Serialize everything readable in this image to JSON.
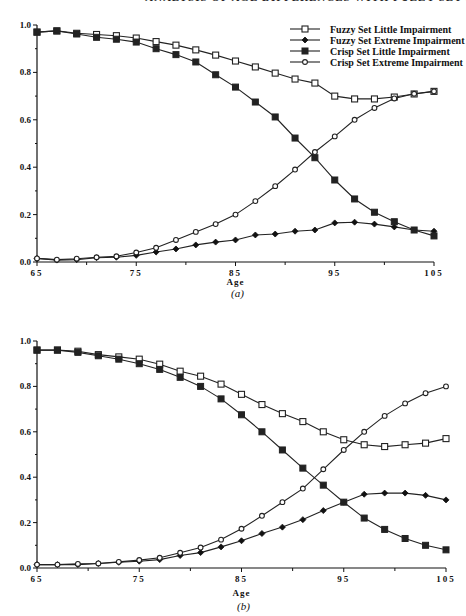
{
  "running_head": "ANALYSIS OF AGE DIFFERENCES WITH FUZZY SET MODELS",
  "chart_data": [
    {
      "type": "line",
      "caption": "(a)",
      "xlabel": "Age",
      "ylabel": "",
      "xlim": [
        65,
        105
      ],
      "ylim": [
        0,
        1.0
      ],
      "xticks": [
        65,
        75,
        85,
        95,
        105
      ],
      "xtick_labels": [
        "65",
        "75",
        "85",
        "95",
        "105"
      ],
      "yticks": [
        0,
        0.2,
        0.4,
        0.6,
        0.8,
        1.0
      ],
      "ytick_labels": [
        "0.0",
        "0.2",
        "0.4",
        "0.6",
        "0.8",
        "1.0"
      ],
      "legend_position": "top-right",
      "x": [
        65,
        67,
        69,
        71,
        73,
        75,
        77,
        79,
        81,
        83,
        85,
        87,
        89,
        91,
        93,
        95,
        97,
        99,
        101,
        103,
        105
      ],
      "series": [
        {
          "name": "Fuzzy Set Little Impairment",
          "marker": "open-square",
          "values": [
            0.97,
            0.975,
            0.965,
            0.96,
            0.955,
            0.945,
            0.93,
            0.915,
            0.895,
            0.873,
            0.848,
            0.823,
            0.797,
            0.772,
            0.755,
            0.7,
            0.688,
            0.688,
            0.696,
            0.709,
            0.72
          ]
        },
        {
          "name": "Fuzzy Set Extreme Impairment",
          "marker": "filled-diamond",
          "values": [
            0.015,
            0.008,
            0.01,
            0.018,
            0.02,
            0.028,
            0.042,
            0.055,
            0.072,
            0.084,
            0.093,
            0.114,
            0.118,
            0.13,
            0.135,
            0.165,
            0.168,
            0.16,
            0.148,
            0.135,
            0.13
          ]
        },
        {
          "name": "Crisp Set Little Impairment",
          "marker": "filled-square",
          "values": [
            0.97,
            0.975,
            0.962,
            0.948,
            0.94,
            0.928,
            0.9,
            0.875,
            0.844,
            0.79,
            0.738,
            0.675,
            0.612,
            0.523,
            0.44,
            0.346,
            0.266,
            0.21,
            0.17,
            0.135,
            0.11
          ]
        },
        {
          "name": "Crisp Set Extreme Impairment",
          "marker": "open-diamond",
          "values": [
            0.015,
            0.01,
            0.014,
            0.02,
            0.024,
            0.04,
            0.06,
            0.093,
            0.127,
            0.16,
            0.2,
            0.257,
            0.32,
            0.39,
            0.464,
            0.53,
            0.6,
            0.65,
            0.69,
            0.71,
            0.72
          ]
        }
      ]
    },
    {
      "type": "line",
      "caption": "(b)",
      "xlabel": "Age",
      "ylabel": "",
      "xlim": [
        65,
        105
      ],
      "ylim": [
        0,
        1.0
      ],
      "xticks": [
        65,
        75,
        85,
        95,
        105
      ],
      "xtick_labels": [
        "65",
        "75",
        "85",
        "95",
        "105"
      ],
      "yticks": [
        0,
        0.2,
        0.4,
        0.6,
        0.8,
        1.0
      ],
      "ytick_labels": [
        "0.0",
        "0.2",
        "0.4",
        "0.6",
        "0.8",
        "1.0"
      ],
      "legend_position": "none",
      "x": [
        65,
        67,
        69,
        71,
        73,
        75,
        77,
        79,
        81,
        83,
        85,
        87,
        89,
        91,
        93,
        95,
        97,
        99,
        101,
        103,
        105
      ],
      "series": [
        {
          "name": "Fuzzy Set Little Impairment",
          "marker": "open-square",
          "values": [
            0.96,
            0.96,
            0.955,
            0.94,
            0.93,
            0.92,
            0.898,
            0.867,
            0.845,
            0.81,
            0.765,
            0.72,
            0.68,
            0.645,
            0.6,
            0.565,
            0.543,
            0.535,
            0.543,
            0.55,
            0.57
          ]
        },
        {
          "name": "Fuzzy Set Extreme Impairment",
          "marker": "filled-diamond",
          "values": [
            0.015,
            0.015,
            0.015,
            0.02,
            0.025,
            0.03,
            0.037,
            0.055,
            0.068,
            0.093,
            0.12,
            0.152,
            0.18,
            0.213,
            0.253,
            0.29,
            0.325,
            0.33,
            0.33,
            0.32,
            0.3
          ]
        },
        {
          "name": "Crisp Set Little Impairment",
          "marker": "filled-square",
          "values": [
            0.96,
            0.96,
            0.95,
            0.935,
            0.92,
            0.9,
            0.875,
            0.84,
            0.8,
            0.745,
            0.675,
            0.6,
            0.52,
            0.44,
            0.365,
            0.29,
            0.22,
            0.17,
            0.13,
            0.1,
            0.08
          ]
        },
        {
          "name": "Crisp Set Extreme Impairment",
          "marker": "open-diamond",
          "values": [
            0.015,
            0.015,
            0.018,
            0.02,
            0.027,
            0.035,
            0.045,
            0.067,
            0.09,
            0.125,
            0.173,
            0.23,
            0.29,
            0.35,
            0.435,
            0.52,
            0.6,
            0.67,
            0.725,
            0.77,
            0.8
          ]
        }
      ]
    }
  ]
}
